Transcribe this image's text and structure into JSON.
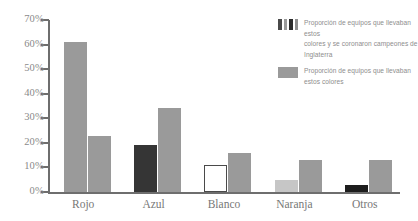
{
  "chart_data": {
    "type": "bar",
    "title": "",
    "xlabel": "",
    "ylabel": "",
    "categories": [
      "Rojo",
      "Azul",
      "Blanco",
      "Naranja",
      "Otros"
    ],
    "series": [
      {
        "name": "Proporción de equipos que llevaban estos colores y se coronaron campeones de Inglaterra",
        "values": [
          61,
          19,
          11,
          5,
          3
        ],
        "swatch": "striped",
        "bar_styles": [
          {
            "fill": "#9a9a9a",
            "border": "none"
          },
          {
            "fill": "#353535",
            "border": "none"
          },
          {
            "fill": "#ffffff",
            "border": "#4a4a4a"
          },
          {
            "fill": "#c6c6c6",
            "border": "none"
          },
          {
            "fill": "#1d1d1d",
            "border": "none"
          }
        ]
      },
      {
        "name": "Proporción de equipos que llevaban estos colores",
        "values": [
          23,
          34,
          16,
          13,
          13
        ],
        "swatch": "solid",
        "bar_styles": [
          {
            "fill": "#9a9a9a",
            "border": "none"
          },
          {
            "fill": "#9a9a9a",
            "border": "none"
          },
          {
            "fill": "#9a9a9a",
            "border": "none"
          },
          {
            "fill": "#9a9a9a",
            "border": "none"
          },
          {
            "fill": "#9a9a9a",
            "border": "none"
          }
        ]
      }
    ],
    "ylim": [
      0,
      70
    ],
    "y_ticks": [
      0,
      10,
      20,
      30,
      40,
      50,
      60,
      70
    ],
    "y_tick_labels": [
      "0%",
      "10%",
      "20%",
      "30%",
      "40%",
      "50%",
      "60%",
      "70%"
    ],
    "grid": false,
    "legend_position": "right-top",
    "axis_color": "#6e6e6e",
    "text_color": "#8a8a8a"
  },
  "legend": {
    "entries": [
      {
        "lines": [
          "Proporción de equipos que llevaban estos",
          "colores y se coronaron campeones de",
          "Inglaterra"
        ]
      },
      {
        "lines": [
          "Proporción de equipos que llevaban",
          "estos colores"
        ]
      }
    ]
  }
}
